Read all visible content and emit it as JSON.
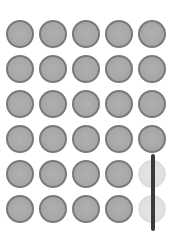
{
  "grid": {
    "rows": 6,
    "cols": 5,
    "dot_diameter": 28,
    "origin_x": 6,
    "origin_y": 20,
    "spacing_x": 33,
    "spacing_y": 35,
    "colors": {
      "dot_fill": "#a8a8a8",
      "dot_border": "#7a7a7a",
      "faded_fill": "#e0e0e0",
      "bar": "#3a3a3a"
    },
    "faded_cells": [
      [
        4,
        4
      ],
      [
        5,
        4
      ]
    ]
  },
  "bar": {
    "x": 151,
    "y_top": 154,
    "y_bottom": 231
  }
}
